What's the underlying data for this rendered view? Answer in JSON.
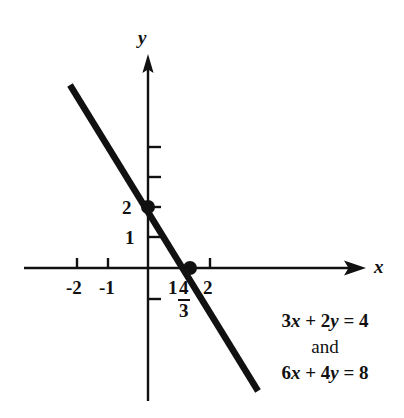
{
  "figure": {
    "axes": {
      "x_label": "x",
      "y_label": "y"
    },
    "x_tick_labels": [
      "-2",
      "-1",
      "1",
      "2"
    ],
    "y_tick_labels": [
      "1",
      "2"
    ],
    "fraction_label": {
      "numerator": "4",
      "denominator": "3"
    },
    "annotations": {
      "equation_1": "3x + 2y = 4",
      "conjunction": "and",
      "equation_2": "6x + 4y = 8"
    },
    "colors": {
      "ink": "#111111",
      "background": "#ffffff"
    }
  },
  "chart_data": {
    "type": "line",
    "title": "",
    "subtitle": "",
    "xlabel": "x",
    "ylabel": "y",
    "xlim": [
      -4,
      7
    ],
    "ylim": [
      -4.5,
      6.8
    ],
    "grid": false,
    "legend": "none",
    "x_ticks": [
      -2,
      -1,
      1,
      2
    ],
    "x_tick_labels": [
      "-2",
      "-1",
      "1",
      "2"
    ],
    "y_ticks": [
      1,
      2,
      3,
      4,
      -1
    ],
    "y_tick_labels": [
      "1",
      "2",
      "",
      "",
      ""
    ],
    "series": [
      {
        "name": "3x + 2y = 4 and 6x + 4y = 8",
        "type": "line",
        "equation": "y = -1.5x + 2",
        "slope": -1.5,
        "intercept": 2,
        "x": [
          -2.52,
          3.55
        ],
        "y": [
          5.78,
          -3.32
        ]
      }
    ],
    "points": [
      {
        "label": "y-intercept",
        "x": 0,
        "y": 2,
        "marker": "filled-circle"
      },
      {
        "label": "x-intercept",
        "x": 1.3333,
        "y": 0,
        "marker": "filled-circle",
        "x_display": "4/3"
      }
    ],
    "annotations": [
      {
        "text": "3x + 2y = 4",
        "x": 5.0,
        "y": -2.1
      },
      {
        "text": "and",
        "x": 5.0,
        "y": -2.85
      },
      {
        "text": "6x + 4y = 8",
        "x": 5.0,
        "y": -3.6
      }
    ]
  }
}
